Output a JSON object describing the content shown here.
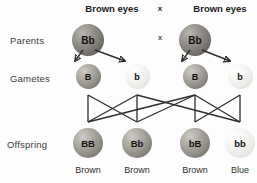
{
  "diagram": {
    "title_left": "Brown eyes",
    "title_right": "Brown eyes",
    "cross_symbol_top": "x",
    "cross_symbol_mid": "x",
    "row_labels": {
      "parents": "Parents",
      "gametes": "Gametes",
      "offspring": "Offspring"
    },
    "parents": [
      {
        "genotype": "Bb",
        "shade": "dark",
        "x": 88
      },
      {
        "genotype": "Bb",
        "shade": "dark",
        "x": 195
      }
    ],
    "gametes": [
      {
        "allele": "B",
        "shade": "mid",
        "x": 88
      },
      {
        "allele": "b",
        "shade": "light",
        "x": 137
      },
      {
        "allele": "B",
        "shade": "mid",
        "x": 195
      },
      {
        "allele": "b",
        "shade": "light",
        "x": 240
      }
    ],
    "offspring": [
      {
        "genotype": "BB",
        "phenotype": "Brown",
        "shade": "mid",
        "x": 88
      },
      {
        "genotype": "Bb",
        "phenotype": "Brown",
        "shade": "mid",
        "x": 137
      },
      {
        "genotype": "bB",
        "phenotype": "Brown",
        "shade": "mid",
        "x": 195
      },
      {
        "genotype": "bb",
        "phenotype": "Blue",
        "shade": "light",
        "x": 240
      }
    ],
    "colors": {
      "text": "#2f2f2f",
      "heading": "#1b1b1b",
      "line": "#2e2e2e",
      "background": "#fdfdfd"
    }
  }
}
